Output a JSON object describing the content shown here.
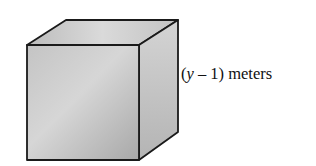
{
  "diagram": {
    "type": "cube",
    "edge_label": {
      "open": "(",
      "variable": "y",
      "operator": " – 1)",
      "unit": " meters",
      "full_text": "(y – 1) meters"
    },
    "colors": {
      "edge": "#1a1a1a",
      "front_face": "#bdbdbd",
      "top_face": "#d0d0d0",
      "side_face": "#c6c6c6"
    }
  }
}
